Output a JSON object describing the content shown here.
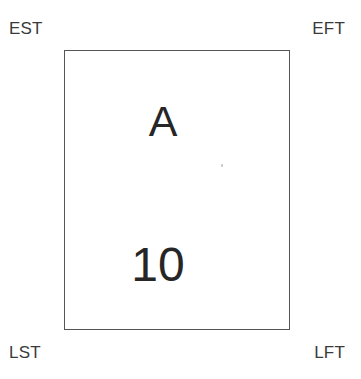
{
  "diagram": {
    "type": "activity-on-node",
    "background_color": "#ffffff",
    "border_color": "#555555",
    "text_color": "#3a3a3a",
    "node": {
      "activity_name": "A",
      "duration": "10"
    },
    "corner_labels": {
      "top_left": "EST",
      "top_right": "EFT",
      "bottom_left": "LST",
      "bottom_right": "LFT"
    }
  }
}
